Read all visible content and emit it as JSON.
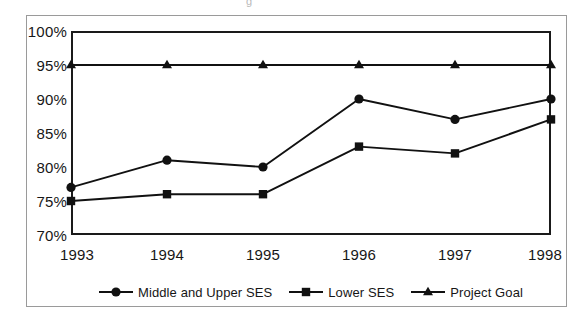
{
  "artifact_glyph": "g",
  "chart_data": {
    "type": "line",
    "title": "",
    "xlabel": "",
    "ylabel": "",
    "categories": [
      "1993",
      "1994",
      "1995",
      "1996",
      "1997",
      "1998"
    ],
    "ylim": [
      70,
      100
    ],
    "yticks": [
      "70%",
      "75%",
      "80%",
      "85%",
      "90%",
      "95%",
      "100%"
    ],
    "ytick_values": [
      70,
      75,
      80,
      85,
      90,
      95,
      100
    ],
    "grid": false,
    "legend_position": "bottom",
    "series": [
      {
        "name": "Middle and Upper SES",
        "marker": "circle",
        "color": "#111111",
        "values": [
          77,
          81,
          80,
          90,
          87,
          90
        ]
      },
      {
        "name": "Lower SES",
        "marker": "square",
        "color": "#111111",
        "values": [
          75,
          76,
          76,
          83,
          82,
          87
        ]
      },
      {
        "name": "Project Goal",
        "marker": "triangle",
        "color": "#111111",
        "values": [
          95,
          95,
          95,
          95,
          95,
          95
        ]
      }
    ]
  }
}
